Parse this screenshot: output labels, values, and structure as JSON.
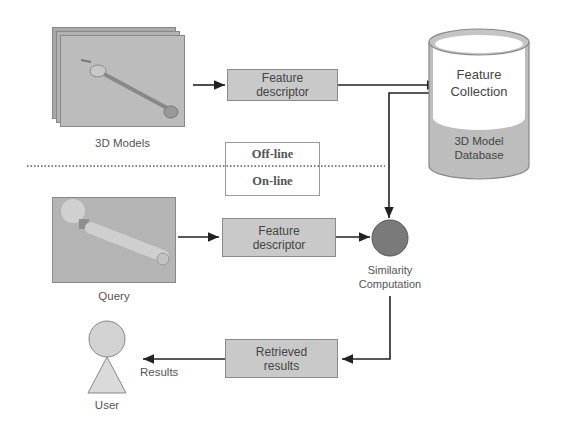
{
  "diagram": {
    "models": {
      "label": "3D Models",
      "icon": "wrench-model-image"
    },
    "query": {
      "label": "Query",
      "icon": "wrench-query-image"
    },
    "offline_descriptor": {
      "line1": "Feature",
      "line2": "descriptor"
    },
    "online_descriptor": {
      "line1": "Feature",
      "line2": "descriptor"
    },
    "database": {
      "top_line1": "Feature",
      "top_line2": "Collection",
      "bottom_line1": "3D Model",
      "bottom_line2": "Database"
    },
    "mode_box": {
      "offline": "Off-line",
      "online": "On-line"
    },
    "similarity": {
      "line1": "Similarity",
      "line2": "Computation"
    },
    "retrieved": {
      "line1": "Retrieved",
      "line2": "results"
    },
    "results_label": "Results",
    "user": {
      "label": "User"
    }
  },
  "colors": {
    "box_fill": "#c9c9c9",
    "circle_fill": "#7a7a7a",
    "line": "#222222",
    "database_fill": "#bdbdbd"
  }
}
